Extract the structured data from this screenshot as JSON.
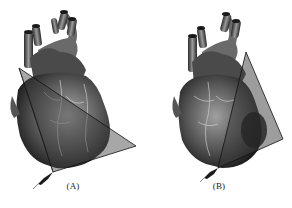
{
  "figure": {
    "panels": [
      {
        "label": "(A)",
        "subject": "heart-illustration",
        "imaging_plane": "triangular scan plane across anterior heart, fanning toward lower right",
        "transducer": "probe at lower-left apex of plane"
      },
      {
        "label": "(B)",
        "subject": "heart-illustration",
        "imaging_plane": "triangular scan plane on right side of heart, fanning upward",
        "transducer": "probe at lower-left apex of plane"
      }
    ],
    "colors": {
      "background": "#ffffff",
      "heart_dark": "#2a2a2a",
      "heart_mid": "#6e6e6e",
      "heart_light": "#b8b8b8",
      "plane_fill": "#3c3c3c",
      "plane_edge": "#111111"
    }
  }
}
